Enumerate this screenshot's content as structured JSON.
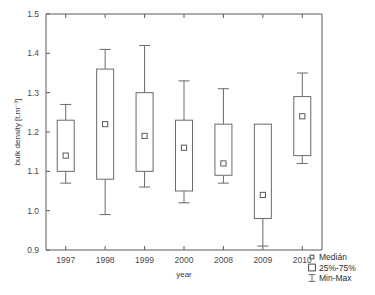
{
  "chart_data": {
    "type": "box",
    "title": "",
    "xlabel": "year",
    "ylabel": "bulk density [t.m-3]",
    "ylabel_display": "bulk density [t.m⁻³]",
    "categories": [
      "1997",
      "1998",
      "1999",
      "2000",
      "2008",
      "2009",
      "2010"
    ],
    "ylim": [
      0.9,
      1.5
    ],
    "yticks": [
      "0.9",
      "1.0",
      "1.1",
      "1.2",
      "1.3",
      "1.4",
      "1.5"
    ],
    "ytick_values": [
      0.9,
      1.0,
      1.1,
      1.2,
      1.3,
      1.4,
      1.5
    ],
    "grid": false,
    "legend_position": "bottom-right",
    "boxes": [
      {
        "category": "1997",
        "min": 1.07,
        "q1": 1.1,
        "median": 1.14,
        "q3": 1.23,
        "max": 1.27
      },
      {
        "category": "1998",
        "min": 0.99,
        "q1": 1.08,
        "median": 1.22,
        "q3": 1.36,
        "max": 1.41
      },
      {
        "category": "1999",
        "min": 1.06,
        "q1": 1.1,
        "median": 1.19,
        "q3": 1.3,
        "max": 1.42
      },
      {
        "category": "2000",
        "min": 1.02,
        "q1": 1.05,
        "median": 1.16,
        "q3": 1.23,
        "max": 1.33
      },
      {
        "category": "2008",
        "min": 1.07,
        "q1": 1.09,
        "median": 1.12,
        "q3": 1.22,
        "max": 1.31
      },
      {
        "category": "2009",
        "min": 0.91,
        "q1": 0.98,
        "median": 1.04,
        "q3": 1.22,
        "max": 1.22
      },
      {
        "category": "2010",
        "min": 1.12,
        "q1": 1.14,
        "median": 1.24,
        "q3": 1.29,
        "max": 1.35
      }
    ],
    "legend": [
      {
        "key": "median",
        "label": "Medián",
        "symbol": "small-square"
      },
      {
        "key": "iqr",
        "label": "25%-75%",
        "symbol": "box"
      },
      {
        "key": "range",
        "label": "Min-Max",
        "symbol": "whisker"
      }
    ],
    "colors": {
      "axis": "#5c5c5c",
      "box_stroke": "#6a6a6a",
      "box_fill": "#ffffff",
      "background": "#ffffff",
      "text": "#2d2d2d"
    }
  }
}
